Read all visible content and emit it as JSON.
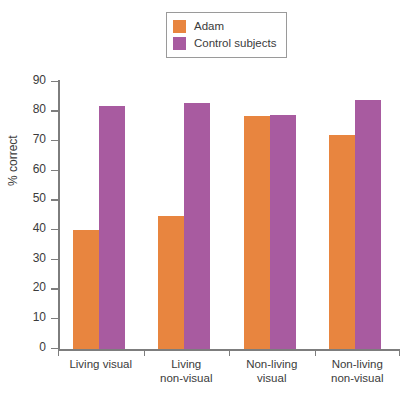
{
  "chart_data": {
    "type": "bar",
    "title": "",
    "xlabel": "",
    "ylabel": "% correct",
    "ylim": [
      0,
      90
    ],
    "ytick_step": 10,
    "yticks": [
      0,
      10,
      20,
      30,
      40,
      50,
      60,
      70,
      80,
      90
    ],
    "grid": false,
    "legend_position": "top-center",
    "categories": [
      "Living visual",
      "Living\nnon-visual",
      "Non-living\nvisual",
      "Non-living\nnon-visual"
    ],
    "category_lines": [
      [
        "Living visual"
      ],
      [
        "Living",
        "non-visual"
      ],
      [
        "Non-living",
        "visual"
      ],
      [
        "Non-living",
        "non-visual"
      ]
    ],
    "series": [
      {
        "name": "Adam",
        "color": "#E8853F",
        "values": [
          40,
          45,
          78.5,
          72
        ]
      },
      {
        "name": "Control subjects",
        "color": "#A85BA0",
        "values": [
          82,
          83,
          79,
          84
        ]
      }
    ]
  },
  "legend": {
    "items": [
      {
        "label": "Adam",
        "color": "#E8853F"
      },
      {
        "label": "Control subjects",
        "color": "#A85BA0"
      }
    ]
  },
  "axes": {
    "y_title": "% correct",
    "y_labels": [
      "90",
      "80",
      "70",
      "60",
      "50",
      "40",
      "30",
      "20",
      "10",
      "0"
    ]
  }
}
